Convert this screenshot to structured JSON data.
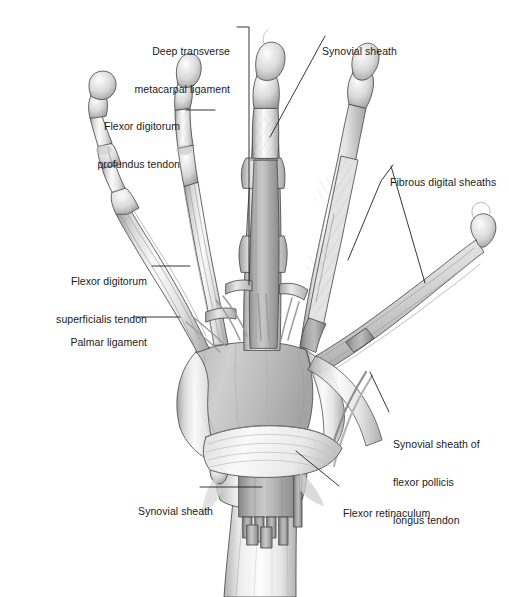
{
  "figure": {
    "width": 509,
    "height": 597,
    "background": "#ffffff",
    "line_color": "#231f20",
    "text_color": "#1a1a1a"
  },
  "labels": [
    {
      "id": "deep-transverse-metacarpal-ligament",
      "lines": [
        "Deep transverse",
        "metacarpal ligament"
      ],
      "align": "right",
      "x": 100,
      "y": 20,
      "width": 130
    },
    {
      "id": "synovial-sheath-top",
      "lines": [
        "Synovial sheath"
      ],
      "align": "left",
      "x": 322,
      "y": 20,
      "width": 110
    },
    {
      "id": "flexor-digitorum-profundus-tendon",
      "lines": [
        "Flexor digitorum",
        "profundus tendon"
      ],
      "align": "right",
      "x": 62,
      "y": 95,
      "width": 118
    },
    {
      "id": "fibrous-digital-sheaths",
      "lines": [
        "Fibrous digital sheaths"
      ],
      "align": "left",
      "x": 390,
      "y": 151,
      "width": 119
    },
    {
      "id": "flexor-digitorum-superficialis-tendon",
      "lines": [
        "Flexor digitorum",
        "superficialis tendon"
      ],
      "align": "right",
      "x": 22,
      "y": 250,
      "width": 125
    },
    {
      "id": "palmar-ligament",
      "lines": [
        "Palmar ligament"
      ],
      "align": "right",
      "x": 46,
      "y": 311,
      "width": 101
    },
    {
      "id": "synovial-sheath-flexor-pollicis-longus-tendon",
      "lines": [
        "Synovial sheath of",
        "flexor pollicis",
        "longus tendon"
      ],
      "align": "left",
      "x": 393,
      "y": 413,
      "width": 116
    },
    {
      "id": "flexor-retinaculum",
      "lines": [
        "Flexor retinaculum"
      ],
      "align": "left",
      "x": 343,
      "y": 482,
      "width": 112
    },
    {
      "id": "synovial-sheath-bottom",
      "lines": [
        "Synovial sheath"
      ],
      "align": "right",
      "x": 112,
      "y": 480,
      "width": 101
    }
  ],
  "leaders": [
    {
      "id": "leader-deep-transverse-metacarpal-ligament",
      "points": "237,27 249,27 249,285"
    },
    {
      "id": "leader-synovial-sheath-top",
      "points": "325,36 270,137"
    },
    {
      "id": "leader-flexor-digitorum-profundus-tendon",
      "points": "186,110 215,110"
    },
    {
      "id": "leader-fibrous-digital-sheaths-a",
      "points": "393,165 381,181 348,260"
    },
    {
      "id": "leader-fibrous-digital-sheaths-b",
      "points": "391,166 425,283"
    },
    {
      "id": "leader-flexor-digitorum-superficialis-tendon",
      "points": "152,266 190,266"
    },
    {
      "id": "leader-palmar-ligament",
      "points": "134,317 180,317"
    },
    {
      "id": "leader-synovial-sheath-flexor-pollicis-longus-tendon",
      "points": "389,412 370,372"
    },
    {
      "id": "leader-flexor-retinaculum",
      "points": "339,486 296,451"
    },
    {
      "id": "leader-synovial-sheath-bottom",
      "points": "200,487 262,487"
    }
  ],
  "anatomy": {
    "structures": [
      "little finger",
      "ring finger",
      "middle finger",
      "index finger",
      "thumb",
      "metacarpals",
      "carpal bones",
      "radius",
      "ulna",
      "flexor retinaculum",
      "common flexor synovial sheath",
      "fibrous digital sheaths",
      "palmar aponeurosis"
    ],
    "palette": {
      "bone_light": "#f2f2f2",
      "bone_mid": "#d8d8d8",
      "bone_shadow": "#b3b3b3",
      "sheath_gray": "#a9a9a9",
      "sheath_gray_dark": "#8e8e8e",
      "tendon_gray": "#c4c4c4",
      "outline": "#4a4a4a"
    }
  }
}
